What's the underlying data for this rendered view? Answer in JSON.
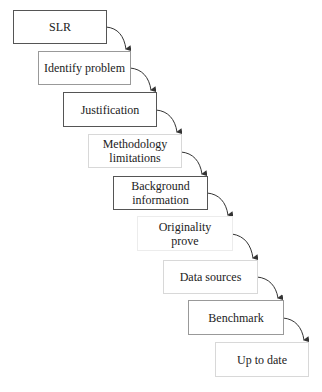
{
  "diagram": {
    "type": "staircase-flow",
    "steps": [
      {
        "label": "SLR"
      },
      {
        "label": "Identify problem"
      },
      {
        "label": "Justification"
      },
      {
        "label": "Methodology limitations"
      },
      {
        "label": "Background information"
      },
      {
        "label": "Originality prove"
      },
      {
        "label": "Data sources"
      },
      {
        "label": "Benchmark"
      },
      {
        "label": "Up to date"
      }
    ],
    "step_labels_display": {
      "s3_line1": "Methodology",
      "s3_line2": "limitations",
      "s4_line1": "Background",
      "s4_line2": "information",
      "s5_line1": "Originality",
      "s5_line2": "prove"
    },
    "connector": "curved-arrow",
    "colors": {
      "border_dark": "#555555",
      "text": "#222222",
      "arrow": "#333333"
    }
  }
}
